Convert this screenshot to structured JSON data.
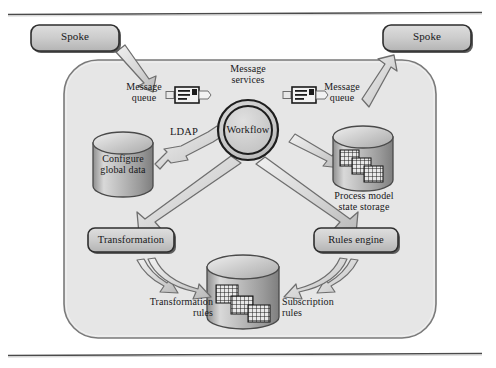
{
  "figure": {
    "title_rule_top": "horizontal-rule",
    "title_rule_bottom": "horizontal-rule",
    "background_color": "#ffffff",
    "hub_fill": "#e3e3e3",
    "node_fill": "#c9c9c9",
    "arrow_fill": "#dcdcdc",
    "stroke_color": "#3a3a3a"
  },
  "spokes": {
    "left": {
      "label": "Spoke"
    },
    "right": {
      "label": "Spoke"
    }
  },
  "hub": {
    "center": {
      "label": "Workflow"
    },
    "message_services": {
      "label_line1": "Message",
      "label_line2": "services"
    },
    "message_queue_left": {
      "label_line1": "Message",
      "label_line2": "queue",
      "icon": "message-queue-icon"
    },
    "message_queue_right": {
      "label_line1": "Message",
      "label_line2": "queue",
      "icon": "message-queue-icon"
    },
    "ldap": {
      "label": "LDAP"
    },
    "configure_global_data": {
      "label_line1": "Configure",
      "label_line2": "global data",
      "icon": "database-cylinder-icon"
    },
    "process_model_state_storage": {
      "label_line1": "Process model",
      "label_line2": "state storage",
      "icon": "database-cylinder-icon"
    },
    "transformation": {
      "label": "Transformation"
    },
    "rules_engine": {
      "label": "Rules engine"
    },
    "transformation_rules": {
      "label_line1": "Transformation",
      "label_line2": "rules"
    },
    "subscription_rules": {
      "label_line1": "Subscription",
      "label_line2": "rules"
    },
    "rules_store": {
      "icon": "database-cylinder-icon"
    }
  }
}
